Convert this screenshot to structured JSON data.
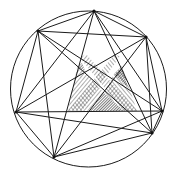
{
  "diagram": {
    "title": "",
    "circle": {
      "cx": 88.5,
      "cy": 89,
      "r": 78
    },
    "points": [
      {
        "id": "A",
        "x": 38,
        "y": 31
      },
      {
        "id": "B",
        "x": 94,
        "y": 11
      },
      {
        "id": "C",
        "x": 146,
        "y": 37
      },
      {
        "id": "F",
        "x": 162,
        "y": 111
      },
      {
        "id": "G",
        "x": 152,
        "y": 133
      },
      {
        "id": "E",
        "x": 54,
        "y": 157
      },
      {
        "id": "D",
        "x": 16,
        "y": 112
      }
    ],
    "chords": "complete-graph",
    "hatch_regions": [
      {
        "name": "light-band-left",
        "points": [
          [
            80,
            58
          ],
          [
            100,
            72
          ],
          [
            120,
            56
          ],
          [
            137,
            111
          ],
          [
            68,
            111
          ]
        ],
        "pattern": "hatch-light"
      },
      {
        "name": "dark-top-left",
        "points": [
          [
            77,
            68
          ],
          [
            82,
            63
          ],
          [
            86,
            73
          ]
        ],
        "pattern": "hatch-dark"
      },
      {
        "name": "dark-right",
        "points": [
          [
            114,
            74
          ],
          [
            122,
            66
          ],
          [
            128,
            88
          ]
        ],
        "pattern": "hatch-dark"
      },
      {
        "name": "dark-bottom",
        "points": [
          [
            90,
            111
          ],
          [
            104,
            93
          ],
          [
            124,
            111
          ]
        ],
        "pattern": "hatch-dark"
      }
    ],
    "colors": {
      "stroke": "#1a1a1a",
      "background": "#ffffff"
    }
  }
}
